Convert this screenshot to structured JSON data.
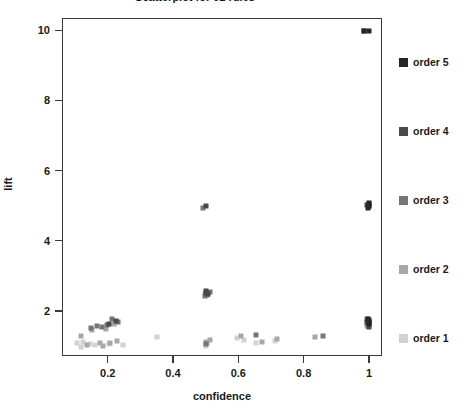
{
  "chart_data": {
    "type": "scatter",
    "title": "Scatterplot for 92 rules",
    "xlabel": "confidence",
    "ylabel": "lift",
    "xlim": [
      0.06,
      1.04
    ],
    "ylim": [
      0.72,
      10.35
    ],
    "xticks": [
      0.2,
      0.4,
      0.6,
      0.8,
      1
    ],
    "xtick_labels": [
      "0.2",
      "0.4",
      "0.6",
      "0.8",
      "1"
    ],
    "yticks": [
      2,
      4,
      6,
      8,
      10
    ],
    "ytick_labels": [
      "2",
      "4",
      "6",
      "8",
      "10"
    ],
    "grid": false,
    "legend_position": "right",
    "legend_title": "",
    "colors": {
      "order_1": "#d2d2d2",
      "order_2": "#a8a8a8",
      "order_3": "#767676",
      "order_4": "#4a4a4a",
      "order_5": "#262626",
      "axis": "#3a3a3a",
      "text": "#1a1a1a",
      "background": "#ffffff"
    },
    "series": [
      {
        "name": "order 1",
        "color": "#d2d2d2",
        "points": [
          [
            0.105,
            1.08
          ],
          [
            0.125,
            1.12
          ],
          [
            0.145,
            1.05
          ],
          [
            0.118,
            0.98
          ],
          [
            0.162,
            1.02
          ],
          [
            0.205,
            1.06
          ],
          [
            0.248,
            1.04
          ],
          [
            0.595,
            1.22
          ],
          [
            0.618,
            1.18
          ],
          [
            0.655,
            1.1
          ],
          [
            0.712,
            1.14
          ],
          [
            0.5,
            1.0
          ],
          [
            0.352,
            1.26
          ]
        ]
      },
      {
        "name": "order 2",
        "color": "#a8a8a8",
        "points": [
          [
            0.118,
            1.3
          ],
          [
            0.138,
            1.02
          ],
          [
            0.152,
            1.45
          ],
          [
            0.175,
            1.1
          ],
          [
            0.185,
            1.0
          ],
          [
            0.196,
            1.5
          ],
          [
            0.208,
            1.08
          ],
          [
            0.218,
            1.62
          ],
          [
            0.228,
            1.14
          ],
          [
            0.5,
            1.12
          ],
          [
            0.505,
            1.08
          ],
          [
            0.512,
            1.18
          ],
          [
            0.608,
            1.3
          ],
          [
            0.672,
            1.12
          ],
          [
            0.718,
            1.2
          ],
          [
            0.835,
            1.26
          ],
          [
            0.995,
            1.58
          ],
          [
            1.0,
            1.68
          ]
        ]
      },
      {
        "name": "order 3",
        "color": "#767676",
        "points": [
          [
            0.148,
            1.52
          ],
          [
            0.168,
            1.58
          ],
          [
            0.182,
            1.56
          ],
          [
            0.198,
            1.6
          ],
          [
            0.212,
            1.78
          ],
          [
            0.232,
            1.68
          ],
          [
            0.492,
            4.95
          ],
          [
            0.5,
            2.5
          ],
          [
            0.505,
            2.46
          ],
          [
            0.512,
            2.55
          ],
          [
            0.498,
            2.42
          ],
          [
            0.5,
            1.05
          ],
          [
            0.655,
            1.32
          ],
          [
            0.86,
            1.28
          ],
          [
            0.998,
            1.66
          ],
          [
            1.0,
            1.72
          ],
          [
            1.0,
            1.62
          ],
          [
            0.995,
            1.78
          ]
        ]
      },
      {
        "name": "order 4",
        "color": "#4a4a4a",
        "points": [
          [
            0.205,
            1.62
          ],
          [
            0.224,
            1.72
          ],
          [
            0.5,
            2.52
          ],
          [
            0.508,
            2.48
          ],
          [
            0.502,
            2.58
          ],
          [
            0.5,
            4.98
          ],
          [
            0.985,
            9.98
          ],
          [
            1.0,
            4.98
          ],
          [
            0.995,
            5.02
          ],
          [
            1.0,
            5.05
          ],
          [
            1.0,
            1.74
          ],
          [
            0.998,
            1.66
          ],
          [
            1.0,
            1.56
          ],
          [
            0.995,
            1.7
          ]
        ]
      },
      {
        "name": "order 5",
        "color": "#262626",
        "points": [
          [
            1.0,
            9.98
          ],
          [
            0.985,
            9.98
          ],
          [
            1.0,
            5.0
          ],
          [
            0.998,
            4.95
          ],
          [
            1.0,
            5.08
          ],
          [
            1.0,
            1.7
          ],
          [
            1.0,
            1.62
          ],
          [
            0.998,
            1.78
          ]
        ]
      }
    ]
  },
  "legend": {
    "items": [
      {
        "label": "order 5",
        "color": "#262626",
        "top": 38
      },
      {
        "label": "order 4",
        "color": "#4a4a4a",
        "top": 107
      },
      {
        "label": "order 3",
        "color": "#767676",
        "top": 176
      },
      {
        "label": "order 2",
        "color": "#a8a8a8",
        "top": 245
      },
      {
        "label": "order 1",
        "color": "#d2d2d2",
        "top": 314
      }
    ]
  }
}
